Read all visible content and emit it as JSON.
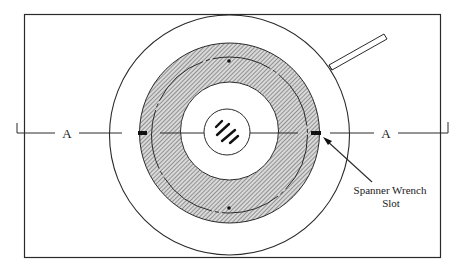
{
  "diagram": {
    "section_labels": {
      "left": "A",
      "right": "A"
    },
    "callout": {
      "line1": "Spanner Wrench",
      "line2": "Slot"
    },
    "colors": {
      "stroke": "#2a2a2a",
      "hatch_bg": "#d9d9d9",
      "hatch_line": "#555555",
      "background": "#ffffff"
    },
    "parts": [
      "outer-rectangle",
      "outer-circle",
      "handle",
      "hatched-ring",
      "mid-ring-line",
      "inner-circle",
      "center-circle",
      "center-hatch-marks",
      "spanner-wrench-slot-left",
      "spanner-wrench-slot-right",
      "section-line-a-a",
      "reference-dot-top",
      "reference-dot-bottom"
    ]
  }
}
